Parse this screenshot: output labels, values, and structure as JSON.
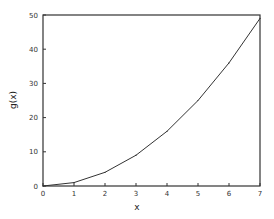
{
  "chart_data": {
    "type": "line",
    "title": "",
    "xlabel": "x",
    "ylabel": "g(x)",
    "xlim": [
      0,
      7
    ],
    "ylim": [
      0,
      50
    ],
    "xticks": [
      0,
      1,
      2,
      3,
      4,
      5,
      6,
      7
    ],
    "yticks": [
      0,
      10,
      20,
      30,
      40,
      50
    ],
    "xtick_labels": [
      "0",
      "1",
      "2",
      "3",
      "4",
      "5",
      "6",
      "7"
    ],
    "ytick_labels": [
      "0",
      "10",
      "20",
      "30",
      "40",
      "50"
    ],
    "grid": false,
    "legend": null,
    "series": [
      {
        "name": "g(x)",
        "x": [
          0,
          1,
          2,
          3,
          4,
          5,
          6,
          7
        ],
        "y": [
          0,
          1,
          4,
          9,
          16,
          25,
          36,
          49
        ]
      }
    ]
  }
}
